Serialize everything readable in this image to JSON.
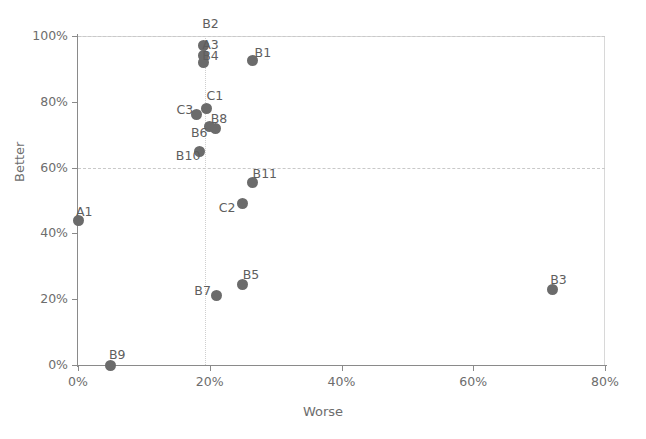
{
  "chart_data": {
    "type": "scatter",
    "title": "",
    "xlabel": "Worse",
    "ylabel": "Better",
    "xlim": [
      0,
      80
    ],
    "ylim": [
      0,
      100
    ],
    "xticks": [
      "0%",
      "20%",
      "40%",
      "60%",
      "80%"
    ],
    "xtick_values": [
      0,
      20,
      40,
      60,
      80
    ],
    "yticks": [
      "0%",
      "20%",
      "40%",
      "60%",
      "80%",
      "100%"
    ],
    "ytick_values": [
      0,
      20,
      40,
      60,
      80,
      100
    ],
    "grid": "dashed horizontal gridlines at 60% and 100%; dotted vertical reference line near 19%",
    "gridlines_h": [
      60,
      100
    ],
    "gridlines_v": [
      19.3
    ],
    "legend": "none",
    "marker_color": "#6b6b6b",
    "points": [
      {
        "label": "B2",
        "x": 19.0,
        "y": 97.0
      },
      {
        "label": "A3",
        "x": 19.0,
        "y": 94.0
      },
      {
        "label": "B4",
        "x": 19.0,
        "y": 92.0
      },
      {
        "label": "B1",
        "x": 26.5,
        "y": 92.5
      },
      {
        "label": "C1",
        "x": 19.5,
        "y": 78.0
      },
      {
        "label": "C3",
        "x": 18.0,
        "y": 76.0
      },
      {
        "label": "B8",
        "x": 20.0,
        "y": 72.5
      },
      {
        "label": "B6",
        "x": 20.8,
        "y": 72.0
      },
      {
        "label": "B10",
        "x": 18.5,
        "y": 65.0
      },
      {
        "label": "B11",
        "x": 26.5,
        "y": 55.5
      },
      {
        "label": "C2",
        "x": 25.0,
        "y": 49.0
      },
      {
        "label": "A1",
        "x": 0.0,
        "y": 44.0
      },
      {
        "label": "B5",
        "x": 25.0,
        "y": 24.5
      },
      {
        "label": "B7",
        "x": 21.0,
        "y": 21.0
      },
      {
        "label": "B3",
        "x": 72.0,
        "y": 23.0
      },
      {
        "label": "B9",
        "x": 5.0,
        "y": 0.0
      }
    ]
  },
  "axes": {
    "x_title": "Worse",
    "y_title": "Better"
  }
}
